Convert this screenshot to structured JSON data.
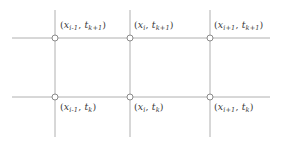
{
  "figure": {
    "name": "finite-difference-grid-stencil",
    "background_color": "#ffffff",
    "line_color": "#b0b0b0",
    "node_stroke_color": "#8a8a8a",
    "node_fill_color": "#ffffff",
    "text_color": "#3a3a3a"
  },
  "grid": {
    "horizontal_lines": [
      {
        "id": "t-level-k-plus-1",
        "y": 38,
        "x_start": 12,
        "x_end": 270,
        "time_level": "t_{k+1}"
      },
      {
        "id": "t-level-k",
        "y": 97,
        "x_start": 12,
        "x_end": 270,
        "time_level": "t_k"
      }
    ],
    "vertical_lines": [
      {
        "id": "x-line-i-minus-1",
        "x": 55,
        "y_start": 10,
        "y_end": 137,
        "space_level": "x_{i-1}"
      },
      {
        "id": "x-line-i",
        "x": 130,
        "y_start": 10,
        "y_end": 137,
        "space_level": "x_i"
      },
      {
        "id": "x-line-i-plus-1",
        "x": 210,
        "y_start": 10,
        "y_end": 137,
        "space_level": "x_{i+1}"
      }
    ]
  },
  "nodes": [
    {
      "id": "node-i-minus-1-k-plus-1",
      "cx": 55,
      "cy": 38,
      "r": 3,
      "label_x": 60,
      "label_y": 19,
      "label": {
        "x_sub": "i-1",
        "t_sub": "k+1"
      }
    },
    {
      "id": "node-i-k-plus-1",
      "cx": 130,
      "cy": 38,
      "r": 3,
      "label_x": 134,
      "label_y": 19,
      "label": {
        "x_sub": "i",
        "t_sub": "k+1"
      }
    },
    {
      "id": "node-i-plus-1-k-plus-1",
      "cx": 210,
      "cy": 38,
      "r": 3,
      "label_x": 214,
      "label_y": 19,
      "label": {
        "x_sub": "i+1",
        "t_sub": "k+1"
      }
    },
    {
      "id": "node-i-minus-1-k",
      "cx": 55,
      "cy": 97,
      "r": 3,
      "label_x": 60,
      "label_y": 101,
      "label": {
        "x_sub": "i-1",
        "t_sub": "k"
      }
    },
    {
      "id": "node-i-k",
      "cx": 130,
      "cy": 97,
      "r": 3,
      "label_x": 134,
      "label_y": 101,
      "label": {
        "x_sub": "i",
        "t_sub": "k"
      }
    },
    {
      "id": "node-i-plus-1-k",
      "cx": 210,
      "cy": 97,
      "r": 3,
      "label_x": 214,
      "label_y": 101,
      "label": {
        "x_sub": "i+1",
        "t_sub": "k"
      }
    }
  ],
  "labels": {
    "open_paren": "(",
    "close_paren": ")",
    "comma": ", ",
    "x_symbol": "x",
    "t_symbol": "t",
    "node_0_x_sub": "i-1",
    "node_0_t_sub": "k+1",
    "node_1_x_sub": "i",
    "node_1_t_sub": "k+1",
    "node_2_x_sub": "i+1",
    "node_2_t_sub": "k+1",
    "node_3_x_sub": "i-1",
    "node_3_t_sub": "k",
    "node_4_x_sub": "i",
    "node_4_t_sub": "k",
    "node_5_x_sub": "i+1",
    "node_5_t_sub": "k"
  }
}
